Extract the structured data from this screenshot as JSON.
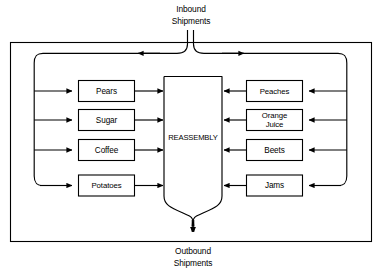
{
  "diagram": {
    "type": "block-flow-diagram",
    "center_node": {
      "label": "REASSEMBLY"
    },
    "captions": {
      "inbound_line1": "Inbound",
      "inbound_line2": "Shipments",
      "outbound_line1": "Outbound",
      "outbound_line2": "Shipments"
    },
    "left_nodes": [
      {
        "label": "Pears"
      },
      {
        "label": "Sugar"
      },
      {
        "label": "Coffee"
      },
      {
        "label": "Potatoes"
      }
    ],
    "right_nodes": [
      {
        "label": "Peaches"
      },
      {
        "label": "Orange",
        "label2": "Juice"
      },
      {
        "label": "Beets"
      },
      {
        "label": "Jams"
      }
    ],
    "colors": {
      "stroke": "#000000",
      "fill": "#ffffff",
      "background": "#ffffff"
    }
  }
}
